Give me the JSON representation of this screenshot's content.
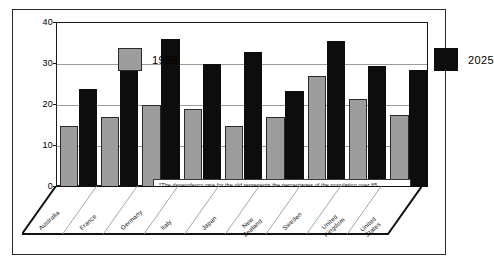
{
  "chart_data": {
    "type": "bar",
    "title": "",
    "xlabel": "",
    "ylabel": "PERCENTAGE",
    "ylim": [
      0,
      40
    ],
    "yticks": [
      "0",
      "10",
      "20",
      "30",
      "40"
    ],
    "grid": true,
    "legend_position": "top-left and top-right inside plot",
    "categories": [
      "Australia",
      "France",
      "Germany",
      "Italy",
      "Japan",
      "New Zealand",
      "Sweden",
      "United Kingdom",
      "United States"
    ],
    "series": [
      {
        "name": "1985",
        "color": "#9d9d9d",
        "values": [
          15,
          17,
          20,
          19,
          15,
          17,
          27,
          21.5,
          17.5
        ]
      },
      {
        "name": "2025",
        "color": "#0d0d0d",
        "values": [
          24,
          30,
          36,
          30,
          33,
          23.5,
          35.5,
          29.5,
          28.5
        ]
      }
    ],
    "annotation_line1": "*The dependency rate for the old represents the percentages of the population over 65,",
    "annotation_line2": "expressed as a percentage of the population aged 15 - 64."
  },
  "legend": {
    "item_1985": "1985",
    "item_2025": "2025"
  },
  "axis": {
    "y_title": "PERCENTAGE"
  },
  "category_labels": [
    {
      "line1": "Australia",
      "line2": ""
    },
    {
      "line1": "France",
      "line2": ""
    },
    {
      "line1": "Germany",
      "line2": ""
    },
    {
      "line1": "Italy",
      "line2": ""
    },
    {
      "line1": "Japan",
      "line2": ""
    },
    {
      "line1": "New",
      "line2": "Zealand"
    },
    {
      "line1": "Sweden",
      "line2": ""
    },
    {
      "line1": "United",
      "line2": "Kingdom"
    },
    {
      "line1": "United",
      "line2": "States"
    }
  ]
}
